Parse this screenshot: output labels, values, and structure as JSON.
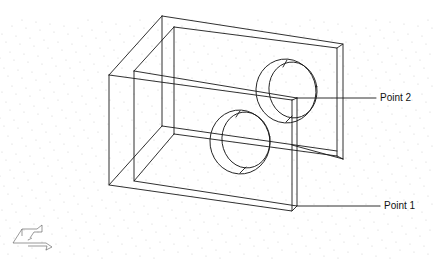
{
  "diagram": {
    "type": "isometric-wireframe",
    "line_color": "#1a1a1a",
    "grid_dot_color": "#c8c8c8",
    "background": "#ffffff"
  },
  "callouts": [
    {
      "id": "point-2",
      "label": "Point 2"
    },
    {
      "id": "point-1",
      "label": "Point 1"
    }
  ],
  "icons": {
    "ucs": "ucs-axis-icon"
  }
}
